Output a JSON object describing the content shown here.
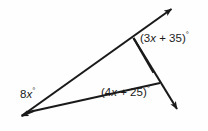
{
  "figure": {
    "kind": "geometry-angle-diagram",
    "background_color": "#fefefe",
    "stroke_color": "#1a1a1a",
    "labels": {
      "upper_right": {
        "full_text": "(3x + 35)°",
        "open_paren": "(",
        "coefficient": "3",
        "variable": "x",
        "operator": " + ",
        "constant": "35",
        "close_paren": ")",
        "degree_symbol": "°"
      },
      "lower_right": {
        "full_text": "(4x + 25)°",
        "open_paren": "(",
        "coefficient": "4",
        "variable": "x",
        "operator": " + ",
        "constant": "25",
        "close_paren": ")",
        "degree_symbol": "°"
      },
      "left_vertex": {
        "full_text": "8x°",
        "coefficient": "8",
        "variable": "x",
        "degree_symbol": "°"
      }
    }
  }
}
